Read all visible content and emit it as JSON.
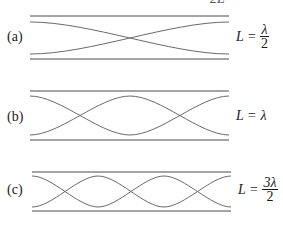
{
  "top_cut_text": "2L",
  "panels": [
    {
      "label": "(a)",
      "eq_lhs": "L =",
      "eq_num": "λ",
      "eq_den": "2",
      "eq_plain": "",
      "half_wavelengths": 1
    },
    {
      "label": "(b)",
      "eq_lhs": "L =",
      "eq_num": "",
      "eq_den": "",
      "eq_plain": "λ",
      "half_wavelengths": 2
    },
    {
      "label": "(c)",
      "eq_lhs": "L =",
      "eq_num": "3λ",
      "eq_den": "2",
      "eq_plain": "",
      "half_wavelengths": 3
    }
  ],
  "colors": {
    "pipe": "#4a4a4a",
    "wave": "#6a6a6a"
  }
}
